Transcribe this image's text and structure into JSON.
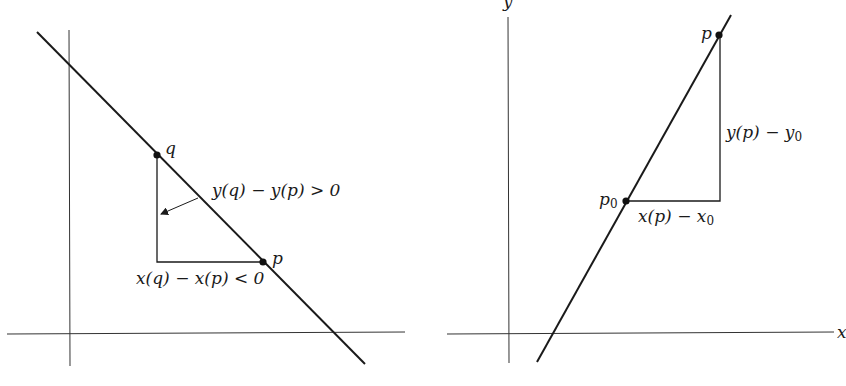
{
  "left_panel": {
    "description": "Line with negative slope; slope sign from differences",
    "points": {
      "q": {
        "label": "q",
        "x": 157,
        "y": 155
      },
      "p": {
        "label": "p",
        "x": 263,
        "y": 262
      }
    },
    "labels": {
      "vertical_difference": "y(q) − y(p) > 0",
      "horizontal_difference": "x(q) − x(p) < 0"
    },
    "colors": {
      "ink": "#1a1a1a",
      "axis": "#333333",
      "background": "#ffffff"
    }
  },
  "right_panel": {
    "description": "Line with positive slope through p0 and p",
    "axis_labels": {
      "x": "x",
      "y": "y"
    },
    "points": {
      "p": {
        "label": "p",
        "x": 719,
        "y": 35
      },
      "p0": {
        "label": "p",
        "subscript": "0",
        "x": 626,
        "y": 201
      }
    },
    "labels": {
      "vertical_difference_main": "y(p) − y",
      "vertical_difference_sub": "0",
      "horizontal_difference_main": "x(p) − x",
      "horizontal_difference_sub": "0"
    }
  }
}
